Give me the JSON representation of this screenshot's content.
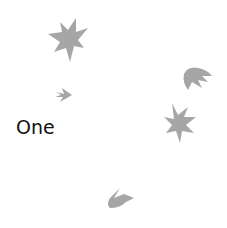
{
  "label": "One",
  "colors": {
    "shape": "#a6a6a6",
    "text": "#111111",
    "background": "#ffffff"
  },
  "shapes": [
    {
      "name": "star-large-top-left",
      "icon": "leaf-star-icon"
    },
    {
      "name": "arrow-small-left",
      "icon": "leaf-arrow-icon"
    },
    {
      "name": "claw-right",
      "icon": "leaf-claw-icon"
    },
    {
      "name": "star-right",
      "icon": "leaf-star-icon"
    },
    {
      "name": "claw-bottom",
      "icon": "leaf-claw-icon"
    }
  ]
}
